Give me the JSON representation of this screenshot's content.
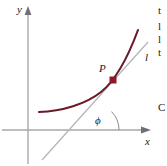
{
  "figure": {
    "axes": {
      "x_label": "x",
      "y_label": "y",
      "axis_color": "#a9a9ad",
      "origin_x": 28,
      "origin_y": 130
    },
    "curve": {
      "color": "#6b1a2a",
      "description": "increasing convex curve",
      "stroke_width": 2
    },
    "tangent_line": {
      "label": "l",
      "color": "#b3b3b8",
      "stroke_width": 1
    },
    "point": {
      "label": "P",
      "marker_color": "#8c1a2b",
      "x": 113,
      "y": 80
    },
    "angle": {
      "label": "ϕ",
      "arc_color": "#8a8a8f",
      "vertex_x": 93,
      "vertex_y": 130
    }
  },
  "edge_text_fragments": [
    {
      "text": "t",
      "top": 4
    },
    {
      "text": "l",
      "top": 20
    },
    {
      "text": "l",
      "top": 33
    },
    {
      "text": "t",
      "top": 46
    },
    {
      "text": "C",
      "top": 101
    }
  ]
}
